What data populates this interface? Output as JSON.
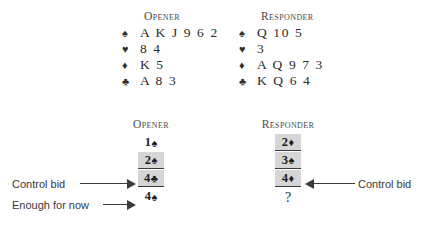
{
  "hands": {
    "opener": {
      "title": "Opener",
      "suits": [
        {
          "symbol": "♠",
          "name": "spades",
          "cards": "A K J 9 6 2"
        },
        {
          "symbol": "♥",
          "name": "hearts",
          "cards": "8 4"
        },
        {
          "symbol": "♦",
          "name": "diamonds",
          "cards": "K 5"
        },
        {
          "symbol": "♣",
          "name": "clubs",
          "cards": "A 8 3"
        }
      ]
    },
    "responder": {
      "title": "Responder",
      "suits": [
        {
          "symbol": "♠",
          "name": "spades",
          "cards": "Q 10 5"
        },
        {
          "symbol": "♥",
          "name": "hearts",
          "cards": "3"
        },
        {
          "symbol": "♦",
          "name": "diamonds",
          "cards": "A Q 9 7 3"
        },
        {
          "symbol": "♣",
          "name": "clubs",
          "cards": "K Q 6 4"
        }
      ]
    }
  },
  "auction": {
    "opener": {
      "title": "Opener",
      "bids": [
        {
          "level": "1",
          "symbol": "♠",
          "suit": "spades"
        },
        {
          "level": "2",
          "symbol": "♠",
          "suit": "spades"
        },
        {
          "level": "4",
          "symbol": "♣",
          "suit": "clubs"
        },
        {
          "level": "4",
          "symbol": "♠",
          "suit": "spades"
        }
      ]
    },
    "responder": {
      "title": "Responder",
      "bids": [
        {
          "level": "2",
          "symbol": "♦",
          "suit": "diamonds"
        },
        {
          "level": "3",
          "symbol": "♠",
          "suit": "spades"
        },
        {
          "level": "4",
          "symbol": "♦",
          "suit": "diamonds"
        }
      ],
      "pending": "?"
    }
  },
  "annotations": {
    "left_control_bid": "Control bid",
    "left_enough_for_now": "Enough for now",
    "right_control_bid": "Control bid"
  },
  "colors": {
    "bid_cell_background": "#d6d6d6",
    "text": "#2b2b2b",
    "annotation_text": "#3a3a3a",
    "page_background": "#ffffff"
  }
}
